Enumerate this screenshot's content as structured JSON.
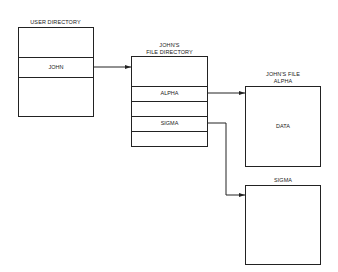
{
  "user_directory": {
    "title": "USER DIRECTORY",
    "entries": [
      "",
      "JOHN",
      ""
    ]
  },
  "file_directory": {
    "title_line1": "JOHN'S",
    "title_line2": "FILE DIRECTORY",
    "entries": [
      "",
      "ALPHA",
      "",
      "SIGMA",
      ""
    ]
  },
  "file_alpha": {
    "title_line1": "JOHN'S FILE",
    "title_line2": "ALPHA",
    "content": "DATA"
  },
  "file_sigma": {
    "title": "SIGMA",
    "content": ""
  },
  "colors": {
    "line": "#222222",
    "background": "#ffffff"
  }
}
